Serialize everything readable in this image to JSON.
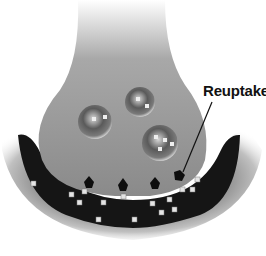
{
  "diagram": {
    "labels": {
      "reuptake": "Reuptake"
    },
    "elements": {
      "presynaptic_terminal": "axon terminal bulb",
      "vesicles": 3,
      "postsynaptic_membrane": "dark curved cell body",
      "neurotransmitters": "small light square particles"
    },
    "colors": {
      "terminal_fill": "#8e8e8e",
      "postsynaptic_dark": "#141414",
      "halo": "#bdbdbd",
      "particle": "#e6e6e6",
      "label_text": "#111111",
      "background": "#ffffff"
    }
  }
}
